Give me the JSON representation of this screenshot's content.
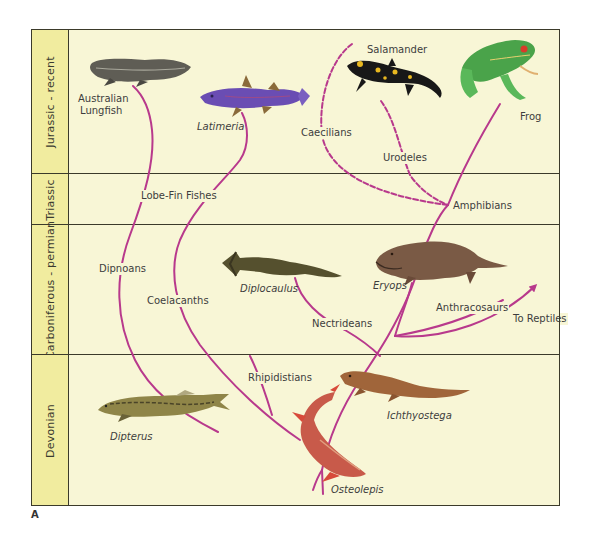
{
  "figure": {
    "label": "A",
    "colors": {
      "period_column": "#f1ec9f",
      "plot_background": "#f8f6d6",
      "grid_lines": "#3b3a2a",
      "lineage": "#b8398c",
      "text": "#3d3d3d"
    }
  },
  "periods": [
    {
      "name": "Jurassic - recent"
    },
    {
      "name": "Triassic"
    },
    {
      "name": "Carboniferous - permian"
    },
    {
      "name": "Devonian"
    }
  ],
  "lineages": {
    "lobe_fin_fishes": "Lobe-Fin Fishes",
    "dipnoans": "Dipnoans",
    "coelacanths": "Coelacanths",
    "rhipidistians": "Rhipidistians",
    "amphibians": "Amphibians",
    "caecilians": "Caecilians",
    "urodeles": "Urodeles",
    "nectrideans": "Nectrideans",
    "anthracosaurs": "Anthracosaurs",
    "to_reptiles": "To Reptiles"
  },
  "organisms": {
    "australian_lungfish": "Australian\nLungfish",
    "australian_lungfish_line1": "Australian",
    "australian_lungfish_line2": "Lungfish",
    "latimeria": "Latimeria",
    "salamander": "Salamander",
    "frog": "Frog",
    "diplocaulus": "Diplocaulus",
    "eryops": "Eryops",
    "dipterus": "Dipterus",
    "ichthyostega": "Ichthyostega",
    "osteolepis": "Osteolepis"
  }
}
